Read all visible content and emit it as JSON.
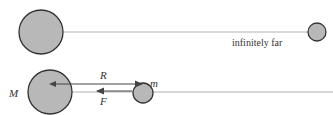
{
  "diagram": {
    "top_scene": {
      "label_far": "infinitely far",
      "big_body": {
        "cx": 41,
        "cy": 32,
        "r": 22
      },
      "small_body": {
        "cx": 317,
        "cy": 32,
        "r": 9
      },
      "line_color": "#b0b0b0"
    },
    "bottom_scene": {
      "label_big_mass": "M",
      "label_small_mass": "m",
      "label_distance": "R",
      "label_force": "F",
      "big_body": {
        "cx": 50,
        "cy": 92,
        "r": 22
      },
      "small_body": {
        "cx": 143,
        "cy": 93,
        "r": 10
      }
    },
    "colors": {
      "body_fill": "#b8b8b8",
      "body_stroke": "#333333",
      "arrow": "#444444"
    }
  }
}
